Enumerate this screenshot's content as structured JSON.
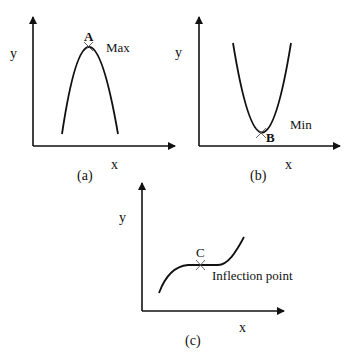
{
  "panels": [
    {
      "id": "a",
      "caption": "(a)",
      "x_label": "x",
      "y_label": "y",
      "point_label": "A",
      "annotation": "Max",
      "curve_type": "concave-down parabola"
    },
    {
      "id": "b",
      "caption": "(b)",
      "x_label": "x",
      "y_label": "y",
      "point_label": "B",
      "annotation": "Min",
      "curve_type": "concave-up parabola"
    },
    {
      "id": "c",
      "caption": "(c)",
      "x_label": "x",
      "y_label": "y",
      "point_label": "C",
      "annotation": "Inflection point",
      "curve_type": "cubic with horizontal inflection"
    }
  ],
  "colors": {
    "stroke": "#111111",
    "background": "#ffffff"
  }
}
